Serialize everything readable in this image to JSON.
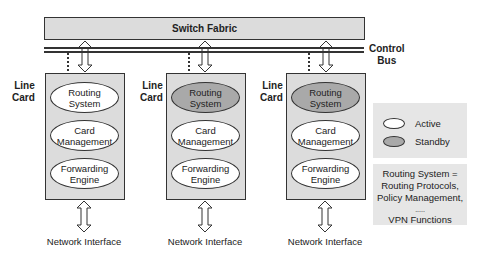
{
  "switch_fabric": {
    "label": "Switch Fabric"
  },
  "control_bus": {
    "label_line1": "Control",
    "label_line2": "Bus"
  },
  "line_cards": [
    {
      "label_line1": "Line",
      "label_line2": "Card",
      "routing_system": {
        "line1": "Routing",
        "line2": "System",
        "state": "active"
      },
      "card_management": {
        "line1": "Card",
        "line2": "Management",
        "state": "active"
      },
      "forwarding_engine": {
        "line1": "Forwarding",
        "line2": "Engine",
        "state": "active"
      },
      "network_interface": "Network Interface"
    },
    {
      "label_line1": "Line",
      "label_line2": "Card",
      "routing_system": {
        "line1": "Routing",
        "line2": "System",
        "state": "standby"
      },
      "card_management": {
        "line1": "Card",
        "line2": "Management",
        "state": "active"
      },
      "forwarding_engine": {
        "line1": "Forwarding",
        "line2": "Engine",
        "state": "active"
      },
      "network_interface": "Network Interface"
    },
    {
      "label_line1": "Line",
      "label_line2": "Card",
      "routing_system": {
        "line1": "Routing",
        "line2": "System",
        "state": "standby"
      },
      "card_management": {
        "line1": "Card",
        "line2": "Management",
        "state": "active"
      },
      "forwarding_engine": {
        "line1": "Forwarding",
        "line2": "Engine",
        "state": "active"
      },
      "network_interface": "Network Interface"
    }
  ],
  "legend": {
    "active": {
      "label": "Active",
      "color": "#ffffff"
    },
    "standby": {
      "label": "Standby",
      "color": "#a9a9a9"
    }
  },
  "note": {
    "line1": "Routing System =",
    "line2": "Routing Protocols,",
    "line3": "Policy Management,",
    "line4": ".....",
    "line5": "VPN Functions"
  },
  "colors": {
    "box_fill": "#dcdcdc",
    "legend_fill": "#e6e6e6",
    "stroke": "#333333"
  }
}
